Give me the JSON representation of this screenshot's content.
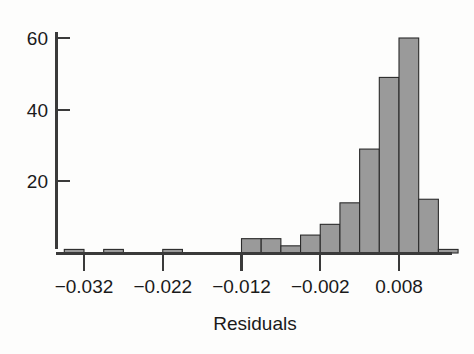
{
  "chart_data": {
    "type": "bar",
    "title": "",
    "subtitle": "",
    "xlabel": "Residuals",
    "ylabel": "",
    "grid": false,
    "legend": "none",
    "bin_width": 0.0025,
    "xlim": [
      -0.0395,
      0.0145
    ],
    "ylim": [
      0,
      63
    ],
    "xticks": [
      -0.032,
      -0.022,
      -0.012,
      -0.002,
      0.008
    ],
    "xtick_labels": [
      "−0.032",
      "−0.022",
      "−0.012",
      "−0.002",
      "0.008"
    ],
    "yticks": [
      20,
      40,
      60
    ],
    "ytick_labels": [
      "20",
      "40",
      "60"
    ],
    "bin_starts": [
      -0.0345,
      -0.0295,
      -0.0245,
      -0.022,
      -0.017,
      -0.0145,
      -0.012,
      -0.0095,
      -0.007,
      -0.0045,
      -0.002,
      0.0005,
      0.003,
      0.0055
    ],
    "categories": [
      "-0.0345",
      "-0.0295",
      "-0.0245",
      "-0.0220",
      "-0.0170",
      "-0.0145",
      "-0.0120",
      "-0.0095",
      "-0.0070",
      "-0.0045",
      "-0.0020",
      "0.0005",
      "0.0030",
      "0.0055"
    ],
    "values": [
      1,
      1,
      0,
      1,
      0,
      0,
      4,
      4,
      2,
      5,
      8,
      14,
      29,
      49
    ],
    "bars": [
      {
        "x0": -0.0345,
        "x1": -0.032,
        "count": 1
      },
      {
        "x0": -0.0295,
        "x1": -0.027,
        "count": 1
      },
      {
        "x0": -0.022,
        "x1": -0.0195,
        "count": 1
      },
      {
        "x0": -0.012,
        "x1": -0.0095,
        "count": 4
      },
      {
        "x0": -0.0095,
        "x1": -0.007,
        "count": 4
      },
      {
        "x0": -0.007,
        "x1": -0.0045,
        "count": 2
      },
      {
        "x0": -0.0045,
        "x1": -0.002,
        "count": 5
      },
      {
        "x0": -0.002,
        "x1": 0.0005,
        "count": 8
      },
      {
        "x0": 0.0005,
        "x1": 0.003,
        "count": 14
      },
      {
        "x0": 0.003,
        "x1": 0.0055,
        "count": 29
      },
      {
        "x0": 0.0055,
        "x1": 0.008,
        "count": 49
      },
      {
        "x0": 0.008,
        "x1": 0.0105,
        "count": 60
      },
      {
        "x0": 0.0105,
        "x1": 0.013,
        "count": 15
      },
      {
        "x0": 0.013,
        "x1": 0.0155,
        "count": 1
      }
    ],
    "colors": {
      "bar_fill": "#9a9a9a",
      "bar_edge": "#2b2b2b",
      "axis": "#3a3a3a",
      "text": "#1a1a1a",
      "background": "#fdfdfc"
    }
  }
}
